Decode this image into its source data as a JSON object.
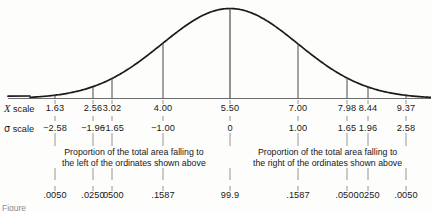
{
  "figure": {
    "kind": "normal-distribution-curve",
    "axis_color": "#6e6e6e",
    "curve_color": "#1a1a1a",
    "ordinate_color": "#4a4a4a",
    "figure_note": "Figure"
  },
  "rows": {
    "x_scale_label_symbol": "X",
    "x_scale_label_text": "scale",
    "sigma_scale_label_symbol": "σ",
    "sigma_scale_label_text": "scale"
  },
  "captions": {
    "left_line1": "Proportion of the total area falling to",
    "left_line2": "the left of the ordinates shown above",
    "right_line1": "Proportion of the total area falling to",
    "right_line2": "the right of the ordinates shown above"
  },
  "chart_data": {
    "type": "line",
    "title": "",
    "xlabel": "X scale",
    "ylabel": "",
    "curve": "normal probability density",
    "mean_x": 5.5,
    "sigma_units_range": [
      -3.2,
      3.2
    ],
    "grid": false,
    "legend": null,
    "ordinates": [
      {
        "x_scale": "1.63",
        "sigma_scale": "−2.58",
        "proportion": ".0050",
        "side": "left",
        "px": 55,
        "z": -2.58
      },
      {
        "x_scale": "2.56",
        "sigma_scale": "−1.96",
        "proportion": ".0250",
        "side": "left",
        "px": 93,
        "z": -1.96
      },
      {
        "x_scale": "3.02",
        "sigma_scale": "−1.65",
        "proportion": ".0500",
        "side": "left",
        "px": 112,
        "z": -1.65
      },
      {
        "x_scale": "4.00",
        "sigma_scale": "−1.00",
        "proportion": ".1587",
        "side": "left",
        "px": 163,
        "z": -1.0
      },
      {
        "x_scale": "5.50",
        "sigma_scale": "0",
        "proportion": "99.9",
        "side": "center",
        "px": 230,
        "z": 0.0
      },
      {
        "x_scale": "7.00",
        "sigma_scale": "1.00",
        "proportion": ".1587",
        "side": "right",
        "px": 298,
        "z": 1.0
      },
      {
        "x_scale": "7.98",
        "sigma_scale": "1.65",
        "proportion": ".0500",
        "side": "right",
        "px": 347,
        "z": 1.65
      },
      {
        "x_scale": "8.44",
        "sigma_scale": "1.96",
        "proportion": ".0250",
        "side": "right",
        "px": 368,
        "z": 1.96
      },
      {
        "x_scale": "9.37",
        "sigma_scale": "2.58",
        "proportion": ".0050",
        "side": "right",
        "px": 406,
        "z": 2.58
      }
    ]
  }
}
